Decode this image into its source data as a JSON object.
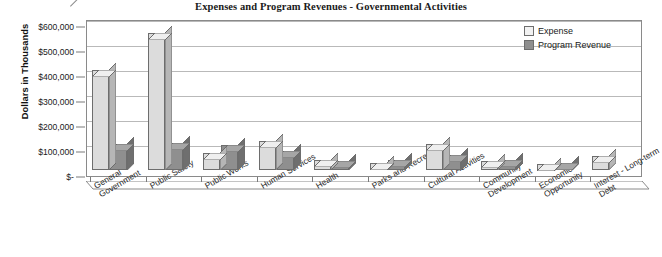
{
  "chart_data": {
    "type": "bar",
    "title": "Expenses and Program Revenues - Governmental Activities",
    "xlabel": "",
    "ylabel": "Dollars in Thousands",
    "ylim": [
      0,
      600000
    ],
    "ytick_labels": [
      "$600,000",
      "$500,000",
      "$400,000",
      "$300,000",
      "$200,000",
      "$100,000",
      "$-"
    ],
    "ytick_values": [
      600000,
      500000,
      400000,
      300000,
      200000,
      100000,
      0
    ],
    "grid": true,
    "legend_position": "top-right",
    "style": "3d-clustered-column",
    "categories": [
      "General Government",
      "Public Safety",
      "Public Works",
      "Human Services",
      "Health",
      "Parks and Recreation",
      "Cultural Activities",
      "Community Development",
      "Economic Opportunity",
      "Interest - Long-term Debt"
    ],
    "category_lines": [
      [
        "General",
        "Government"
      ],
      [
        "Public Safety"
      ],
      [
        "Public Works"
      ],
      [
        "Human Services"
      ],
      [
        "Health"
      ],
      [
        "Parks and Recreation"
      ],
      [
        "Cultural Activities"
      ],
      [
        "Community",
        "Development"
      ],
      [
        "Economic",
        "Opportunity"
      ],
      [
        "Interest - Long-term",
        "Debt"
      ]
    ],
    "series": [
      {
        "name": "Expense",
        "color": "#dcdcdc",
        "values": [
          400000,
          550000,
          70000,
          115000,
          40000,
          30000,
          105000,
          35000,
          25000,
          55000
        ]
      },
      {
        "name": "Program Revenue",
        "color": "#8f8f8f",
        "values": [
          105000,
          110000,
          100000,
          75000,
          35000,
          40000,
          60000,
          40000,
          30000,
          0
        ]
      }
    ]
  },
  "legend": {
    "items": [
      {
        "label": "Expense",
        "swatch": "expense"
      },
      {
        "label": "Program Revenue",
        "swatch": "revenue"
      }
    ]
  }
}
